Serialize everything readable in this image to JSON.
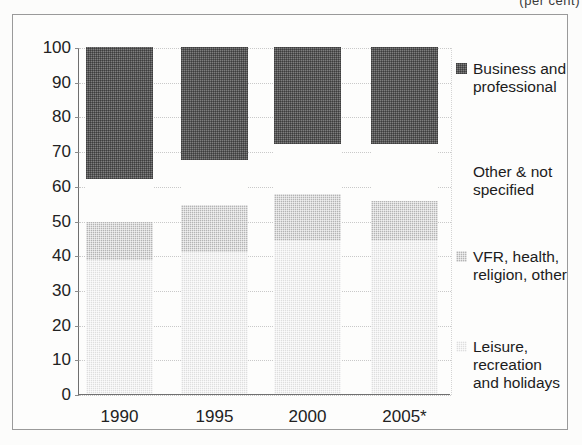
{
  "caption": "(per cent)",
  "chart_data": {
    "type": "bar",
    "stacked": true,
    "title": "",
    "subtitle": "",
    "xlabel": "",
    "ylabel": "",
    "ylim": [
      0,
      100
    ],
    "yticks": [
      0,
      10,
      20,
      30,
      40,
      50,
      60,
      70,
      80,
      90,
      100
    ],
    "ytick_labels": [
      "0",
      "10",
      "20",
      "30",
      "40",
      "50",
      "60",
      "70",
      "80",
      "90",
      "100"
    ],
    "grid": true,
    "legend_position": "right",
    "categories": [
      "1990",
      "1995",
      "2000",
      "2005*"
    ],
    "series": [
      {
        "name": "Leisure, recreation and holidays",
        "legend_label": "Leisure, recreation\nand holidays",
        "color": "#dedede",
        "values": [
          38.5,
          41.0,
          44.0,
          44.0
        ]
      },
      {
        "name": "VFR, health, religion, other",
        "legend_label": "VFR, health,\nreligion, other",
        "color": "#b4b4b4",
        "values": [
          11.0,
          13.5,
          13.5,
          11.5
        ]
      },
      {
        "name": "Other & not specified",
        "legend_label": "Other & not\nspecified",
        "color": "#fdfdfc",
        "values": [
          12.5,
          13.0,
          14.5,
          16.5
        ]
      },
      {
        "name": "Business and professional",
        "legend_label": "Business and\nprofessional",
        "color": "#7e7e7e",
        "values": [
          38.0,
          32.5,
          28.0,
          28.0
        ]
      }
    ],
    "segment_boundaries": {
      "1990": {
        "leisure_top": 38.5,
        "vfr_top": 49.5,
        "other_top": 62.0,
        "business_top": 100
      },
      "1995": {
        "leisure_top": 41.0,
        "vfr_top": 54.5,
        "other_top": 67.5,
        "business_top": 100
      },
      "2000": {
        "leisure_top": 44.0,
        "vfr_top": 57.5,
        "other_top": 72.0,
        "business_top": 100
      },
      "2005*": {
        "leisure_top": 44.0,
        "vfr_top": 55.5,
        "other_top": 72.0,
        "business_top": 100
      }
    }
  },
  "legend": {
    "entries": [
      {
        "label": "Business and\nprofessional",
        "swatch": "business-swatch",
        "top": 12
      },
      {
        "label": "Other & not\nspecified",
        "swatch": "other-swatch",
        "top": 115
      },
      {
        "label": "VFR, health,\nreligion, other",
        "swatch": "vfr-swatch",
        "top": 200
      },
      {
        "label": "Leisure, recreation\nand holidays",
        "swatch": "leisure-swatch",
        "top": 290
      }
    ]
  }
}
